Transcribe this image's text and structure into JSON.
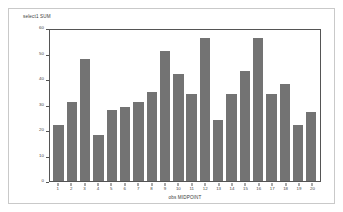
{
  "chart_data": {
    "type": "bar",
    "title": "",
    "subtitle": "",
    "ylabel": "select1 SUM",
    "xlabel": "obs MIDPOINT",
    "categories": [
      "1",
      "2",
      "3",
      "4",
      "5",
      "6",
      "7",
      "8",
      "9",
      "10",
      "11",
      "12",
      "13",
      "14",
      "15",
      "16",
      "17",
      "18",
      "19",
      "20"
    ],
    "values": [
      22,
      31,
      48,
      18,
      28,
      29,
      31,
      35,
      51,
      42,
      34,
      56,
      24,
      34,
      43,
      56,
      34,
      38,
      22,
      27
    ],
    "ylim": [
      0,
      60
    ],
    "yticks": [
      0,
      10,
      20,
      30,
      40,
      50,
      60
    ],
    "ytick_labels": [
      "0",
      "10",
      "20",
      "30",
      "40",
      "50",
      "60"
    ],
    "xtick_labels": [
      "1",
      "2",
      "3",
      "4",
      "5",
      "6",
      "7",
      "8",
      "9",
      "10",
      "11",
      "12",
      "13",
      "14",
      "15",
      "16",
      "17",
      "18",
      "19",
      "20"
    ],
    "grid": false,
    "legend": null,
    "legend_position": "none",
    "bar_color": "#737373",
    "axis_color": "#555555",
    "plot_background": "#ffffff",
    "frame_color": "#c9c9c9"
  }
}
